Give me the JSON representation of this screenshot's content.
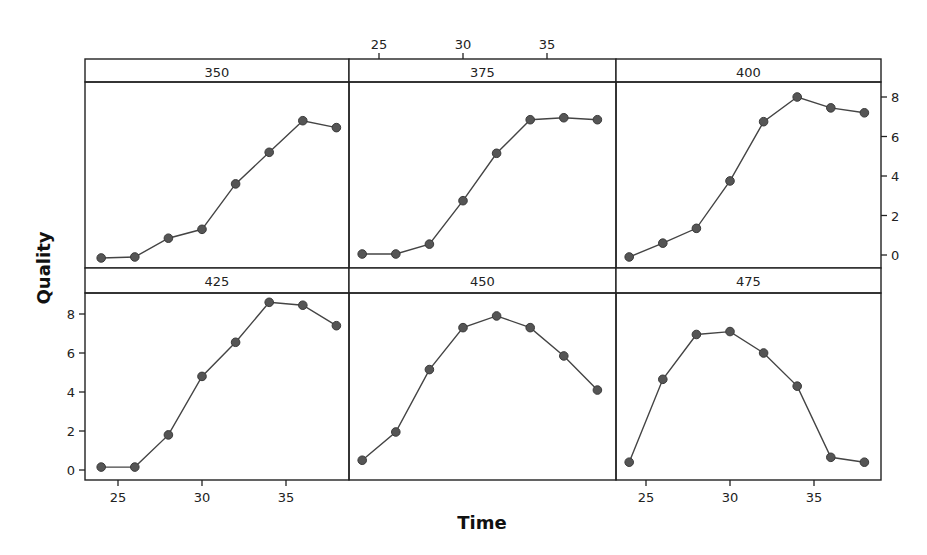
{
  "chart_data": {
    "type": "line",
    "layout": "trellis 2x3 panels",
    "xlabel": "Time",
    "ylabel": "Quality",
    "x": [
      24,
      26,
      28,
      30,
      32,
      34,
      36,
      38
    ],
    "x_ticks": [
      25,
      30,
      35
    ],
    "y_ticks": [
      0,
      2,
      4,
      6,
      8
    ],
    "xlim": [
      23.2,
      39
    ],
    "ylim": [
      -0.6,
      9.0
    ],
    "grid": false,
    "legend": null,
    "series": [
      {
        "name": "350",
        "values": [
          -0.15,
          -0.1,
          0.85,
          1.3,
          3.6,
          5.2,
          6.8,
          6.45
        ]
      },
      {
        "name": "375",
        "values": [
          0.05,
          0.05,
          0.55,
          2.75,
          5.15,
          6.85,
          6.95,
          6.85
        ]
      },
      {
        "name": "400",
        "values": [
          -0.1,
          0.6,
          1.35,
          3.75,
          6.75,
          8.0,
          7.45,
          7.2
        ]
      },
      {
        "name": "425",
        "values": [
          0.15,
          0.15,
          1.8,
          4.8,
          6.55,
          8.6,
          8.45,
          7.4
        ]
      },
      {
        "name": "450",
        "values": [
          0.5,
          1.95,
          5.15,
          7.3,
          7.9,
          7.3,
          5.85,
          4.1
        ]
      },
      {
        "name": "475",
        "values": [
          0.4,
          4.65,
          6.95,
          7.1,
          6.0,
          4.3,
          0.65,
          0.4
        ]
      }
    ]
  },
  "axes": {
    "x_title": "Time",
    "y_title": "Quality",
    "x_tick_labels": [
      "25",
      "30",
      "35"
    ],
    "y_tick_labels": [
      "0",
      "2",
      "4",
      "6",
      "8"
    ]
  },
  "colors": {
    "line": "#444444",
    "marker": "#555555",
    "frame": "#222222",
    "background": "#ffffff"
  }
}
